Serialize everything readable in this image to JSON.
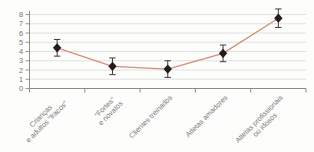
{
  "chart_data": {
    "type": "line",
    "title": "",
    "xlabel": "",
    "ylabel": "",
    "categories": [
      "Crianças e adultos “fracos”",
      "“Fortes” e novatos",
      "Clientes treinados",
      "Atletas amadores",
      "Atletas profissionais ou idosos"
    ],
    "category_lines": [
      [
        "Crianças",
        "e adultos “fracos”"
      ],
      [
        "“Fortes”",
        "e novatos"
      ],
      [
        "Clientes treinados"
      ],
      [
        "Atletas amadores"
      ],
      [
        "Atletas profissionais",
        "ou idosos"
      ]
    ],
    "values": [
      4.4,
      2.4,
      2.1,
      3.8,
      7.6
    ],
    "error_low": [
      3.5,
      1.5,
      1.2,
      2.9,
      6.6
    ],
    "error_high": [
      5.3,
      3.3,
      3.0,
      4.7,
      8.6
    ],
    "marker": "diamond",
    "ylim": [
      0,
      8
    ],
    "ytick_step": 1,
    "ytick_labels": [
      "0",
      "1",
      "2",
      "3",
      "4",
      "5",
      "6",
      "7",
      "8"
    ],
    "grid": true,
    "legend": false,
    "colors": {
      "line": "#d68c7a",
      "marker": "#211c1d",
      "error_bar": "#3f3b3c",
      "gridline": "#dddddb",
      "axis": "#8f8f8f",
      "tick_label": "#757472",
      "category_label": "#7a7978",
      "background": "#fdfdfb"
    }
  }
}
